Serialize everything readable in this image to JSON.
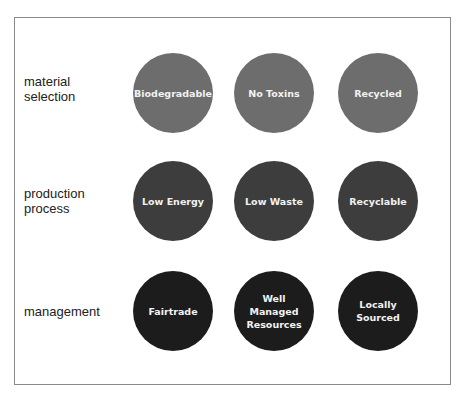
{
  "diagram": {
    "rows": [
      {
        "label": "material\nselection",
        "color": "#6d6d6d",
        "items": [
          "Biodegradable",
          "No Toxins",
          "Recycled"
        ]
      },
      {
        "label": "production\nprocess",
        "color": "#3d3d3d",
        "items": [
          "Low Energy",
          "Low Waste",
          "Recyclable"
        ]
      },
      {
        "label": "management",
        "color": "#1c1c1c",
        "items": [
          "Fairtrade",
          "Well\nManaged\nResources",
          "Locally\nSourced"
        ]
      }
    ]
  }
}
